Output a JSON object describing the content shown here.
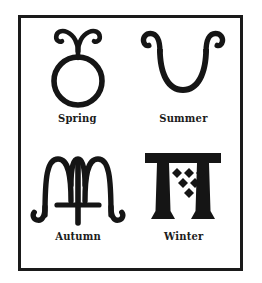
{
  "plate": {
    "title": "Symbols of the Four Seasons",
    "border_color": "#1a1a1a",
    "ink_color": "#151515",
    "background_color": "#ffffff"
  },
  "symbols": [
    {
      "id": "spring",
      "label": "Spring",
      "glyph_name": "circle-with-two-curled-horns",
      "description": "A bold open circle surmounted by a stem that splits into two outward-curling horns"
    },
    {
      "id": "summer",
      "label": "Summer",
      "glyph_name": "u-shape-with-curled-ends",
      "description": "A broad U-shaped stroke whose two upper ends curl outward into hooks"
    },
    {
      "id": "autumn",
      "label": "Autumn",
      "glyph_name": "m-shape-with-cross-tail",
      "description": "An M-like figure with hooked legs whose central stem carries a horizontal crossbar"
    },
    {
      "id": "winter",
      "label": "Winter",
      "glyph_name": "double-pillar-with-six-diamonds",
      "description": "Two serifed pillars joined by a common lintel, with six diamonds in a 3-2-1 triangular arrangement"
    }
  ]
}
